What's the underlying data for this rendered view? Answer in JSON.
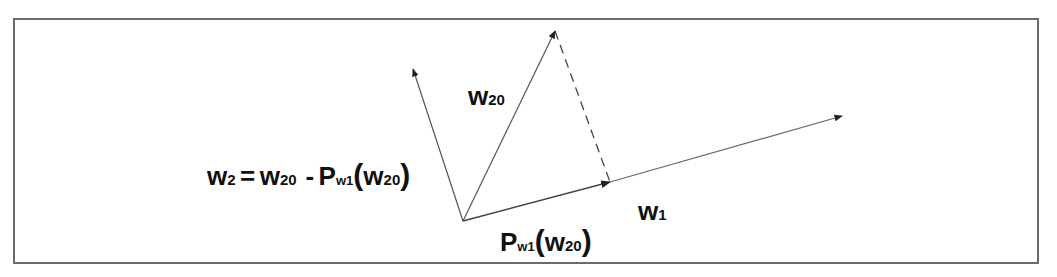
{
  "diagram": {
    "border_color": "#6b6b6b",
    "line_color": "#555555",
    "text_color": "#111111",
    "origin": [
      463,
      221
    ],
    "vectors": [
      {
        "id": "w2",
        "label": "w2",
        "tip": [
          413,
          69
        ],
        "style": "solid"
      },
      {
        "id": "w20",
        "label": "w20",
        "tip": [
          555,
          31
        ],
        "style": "solid"
      },
      {
        "id": "proj",
        "label": "Pw1(w20)",
        "tip": [
          610,
          182
        ],
        "style": "solid"
      },
      {
        "id": "w1",
        "label": "w1",
        "tip": [
          842,
          116
        ],
        "style": "solid"
      }
    ],
    "dashed_segment": {
      "from": [
        555,
        31
      ],
      "to": [
        610,
        182
      ]
    },
    "labels": {
      "equation": {
        "w": "w",
        "w_sub": "2",
        "eq": "=",
        "w20": "w",
        "w20_sub": "20",
        "minus": "-",
        "P": "P",
        "P_sub_w": "w",
        "P_sub_1": "1",
        "lparen": "(",
        "arg_w": "w",
        "arg_sub": "20",
        "rparen": ")"
      },
      "w20": {
        "w": "w",
        "sub": "20"
      },
      "w1": {
        "w": "w",
        "sub": "1"
      },
      "projection": {
        "P": "P",
        "sub_w": "w",
        "sub_1": "1",
        "lparen": "(",
        "arg_w": "w",
        "arg_sub": "20",
        "rparen": ")"
      }
    }
  }
}
